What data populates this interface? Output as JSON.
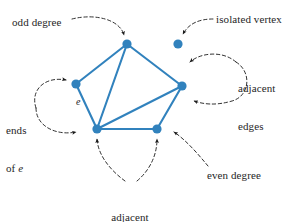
{
  "figure": {
    "type": "graph-theory-diagram",
    "background_color": "#ffffff",
    "vertex_color": "#3182bd",
    "edge_color": "#3182bd",
    "annotation_color": "#262626",
    "annotation_line_style": "dashed"
  },
  "graph": {
    "vertices": [
      {
        "id": "top",
        "label": "",
        "x": 127,
        "y": 44,
        "r": 4.5,
        "degree": 3,
        "isolated": false
      },
      {
        "id": "left",
        "label": "",
        "x": 76,
        "y": 84,
        "r": 4.5,
        "degree": 2,
        "isolated": false
      },
      {
        "id": "right",
        "label": "",
        "x": 182,
        "y": 86,
        "r": 4.5,
        "degree": 4,
        "isolated": false
      },
      {
        "id": "bottom-left",
        "label": "",
        "x": 97,
        "y": 129,
        "r": 4.5,
        "degree": 5,
        "isolated": false
      },
      {
        "id": "bottom-right",
        "label": "",
        "x": 157,
        "y": 129,
        "r": 4.5,
        "degree": 3,
        "isolated": false
      },
      {
        "id": "isolated",
        "label": "",
        "x": 178,
        "y": 44,
        "r": 4.5,
        "degree": 0,
        "isolated": true
      }
    ],
    "edges": [
      {
        "id": "e",
        "from": "left",
        "to": "top",
        "label": "e"
      },
      {
        "id": "e2",
        "from": "left",
        "to": "bottom-left",
        "label": ""
      },
      {
        "id": "e3",
        "from": "top",
        "to": "bottom-left",
        "label": ""
      },
      {
        "id": "e4",
        "from": "top",
        "to": "right",
        "label": ""
      },
      {
        "id": "e5",
        "from": "right",
        "to": "bottom-left",
        "label": ""
      },
      {
        "id": "e6",
        "from": "right",
        "to": "bottom-right",
        "label": ""
      },
      {
        "id": "e7",
        "from": "bottom-left",
        "to": "bottom-right",
        "label": ""
      }
    ],
    "edge_labels": [
      {
        "text": "e",
        "x": 76,
        "y": 96
      }
    ]
  },
  "annotations": [
    {
      "id": "odd-degree",
      "text": "odd degree",
      "x": 12,
      "y": 16,
      "align": "left",
      "target": "top-vertex"
    },
    {
      "id": "isolated-vertex",
      "text": "isolated vertex",
      "x": 216,
      "y": 13,
      "align": "left",
      "target": "isolated-vertex"
    },
    {
      "id": "adjacent-edges",
      "line1": "adjacent",
      "line2": "edges",
      "x": 238,
      "y": 57,
      "align": "left",
      "target": "two-edges-at-right-vertex"
    },
    {
      "id": "ends-of-e",
      "line1": "ends",
      "line2": "of e",
      "line2_plain": "of ",
      "line2_italic": "e",
      "x": 6,
      "y": 99,
      "align": "left",
      "target": "left-and-bottom-left-vertices"
    },
    {
      "id": "adjacent-vertices",
      "line1": "adjacent",
      "line2": "vertices",
      "x": 130,
      "y": 186,
      "align": "center",
      "target": "two-bottom-vertices"
    },
    {
      "id": "even-degree",
      "text": "even degree",
      "x": 207,
      "y": 169,
      "align": "left",
      "target": "bottom-right-area"
    }
  ]
}
